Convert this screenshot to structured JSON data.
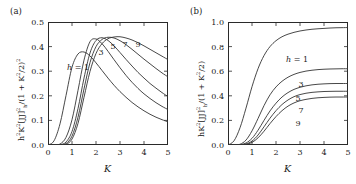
{
  "figure": {
    "panels": [
      {
        "tag": "(a)",
        "xlabel": "K",
        "ylabel_html": "h<sup>2</sup>K<sup>2</sup>[JJ]<sup>2</sup><sub>h</sub>/(1 + K<sup>2</sup>/2)<sup>2</sup>",
        "ylabel_text": "h2K2[JJ]2h/(1+K2/2)2",
        "yticks": [
          "0.0",
          "0.1",
          "0.2",
          "0.3",
          "0.4",
          "0.5"
        ],
        "xticks": [
          "0",
          "1",
          "2",
          "3",
          "4",
          "5"
        ],
        "curve_labels": [
          "h = 1",
          "3",
          "5",
          "7",
          "9"
        ]
      },
      {
        "tag": "(b)",
        "xlabel": "K",
        "ylabel_html": "hK<sup>2</sup>[JJ]<sup>2</sup><sub>h</sub>/(1 + K<sup>2</sup>/2)",
        "ylabel_text": "hK2[JJ]2h/(1+K2/2)",
        "yticks": [
          "0.0",
          "0.2",
          "0.4",
          "0.6",
          "0.8",
          "1.0"
        ],
        "xticks": [
          "0",
          "1",
          "2",
          "3",
          "4",
          "5"
        ],
        "curve_labels": [
          "h = 1",
          "3",
          "5",
          "7",
          "9"
        ]
      }
    ]
  },
  "chart_data": [
    {
      "type": "line",
      "panel": "a",
      "title": "",
      "xlabel": "K",
      "ylabel": "h^2 K^2 [JJ]^2_h / (1 + K^2/2)^2",
      "xlim": [
        0,
        5
      ],
      "ylim": [
        0,
        0.5
      ],
      "xticks": [
        0,
        1,
        2,
        3,
        4,
        5
      ],
      "yticks": [
        0.0,
        0.1,
        0.2,
        0.3,
        0.4,
        0.5
      ],
      "grid": false,
      "legend": "inline-curve-labels",
      "x": [
        0,
        0.25,
        0.5,
        0.75,
        1.0,
        1.25,
        1.5,
        1.75,
        2.0,
        2.25,
        2.5,
        2.75,
        3.0,
        3.25,
        3.5,
        3.75,
        4.0,
        4.25,
        4.5,
        4.75,
        5.0
      ],
      "series": [
        {
          "name": "h = 1",
          "peak_x": 1.2,
          "peak_y": 0.378,
          "values": [
            0.0,
            0.017,
            0.086,
            0.201,
            0.316,
            0.37,
            0.378,
            0.362,
            0.334,
            0.303,
            0.272,
            0.243,
            0.217,
            0.194,
            0.173,
            0.155,
            0.139,
            0.125,
            0.113,
            0.103,
            0.094
          ]
        },
        {
          "name": "3",
          "peak_x": 1.85,
          "peak_y": 0.432,
          "values": [
            0.0,
            0.0,
            0.004,
            0.031,
            0.103,
            0.222,
            0.345,
            0.42,
            0.431,
            0.412,
            0.381,
            0.347,
            0.314,
            0.283,
            0.255,
            0.23,
            0.208,
            0.189,
            0.172,
            0.157,
            0.144
          ]
        },
        {
          "name": "5",
          "peak_x": 2.2,
          "peak_y": 0.437,
          "values": [
            0.0,
            0.0,
            0.001,
            0.012,
            0.055,
            0.148,
            0.272,
            0.374,
            0.425,
            0.436,
            0.425,
            0.403,
            0.376,
            0.348,
            0.321,
            0.295,
            0.272,
            0.25,
            0.231,
            0.213,
            0.197
          ]
        },
        {
          "name": "7",
          "peak_x": 2.5,
          "peak_y": 0.44,
          "values": [
            0.0,
            0.0,
            0.0,
            0.006,
            0.036,
            0.113,
            0.228,
            0.335,
            0.4,
            0.429,
            0.438,
            0.435,
            0.424,
            0.408,
            0.389,
            0.369,
            0.349,
            0.33,
            0.311,
            0.293,
            0.277
          ]
        },
        {
          "name": "9",
          "peak_x": 2.85,
          "peak_y": 0.441,
          "values": [
            0.0,
            0.0,
            0.0,
            0.003,
            0.024,
            0.088,
            0.194,
            0.299,
            0.372,
            0.412,
            0.432,
            0.439,
            0.44,
            0.435,
            0.427,
            0.416,
            0.403,
            0.389,
            0.375,
            0.361,
            0.347
          ]
        }
      ]
    },
    {
      "type": "line",
      "panel": "b",
      "title": "",
      "xlabel": "K",
      "ylabel": "h K^2 [JJ]^2_h / (1 + K^2/2)",
      "xlim": [
        0,
        5
      ],
      "ylim": [
        0,
        1.0
      ],
      "xticks": [
        0,
        1,
        2,
        3,
        4,
        5
      ],
      "yticks": [
        0.0,
        0.2,
        0.4,
        0.6,
        0.8,
        1.0
      ],
      "grid": false,
      "legend": "inline-curve-labels",
      "x": [
        0,
        0.25,
        0.5,
        0.75,
        1.0,
        1.25,
        1.5,
        1.75,
        2.0,
        2.25,
        2.5,
        2.75,
        3.0,
        3.25,
        3.5,
        3.75,
        4.0,
        4.25,
        4.5,
        4.75,
        5.0
      ],
      "series": [
        {
          "name": "h = 1",
          "value_at_5": 0.955,
          "values": [
            0.0,
            0.034,
            0.14,
            0.3,
            0.474,
            0.62,
            0.727,
            0.8,
            0.848,
            0.88,
            0.901,
            0.916,
            0.927,
            0.935,
            0.941,
            0.945,
            0.948,
            0.951,
            0.953,
            0.954,
            0.955
          ]
        },
        {
          "name": "3",
          "value_at_5": 0.62,
          "values": [
            0.0,
            0.0,
            0.006,
            0.04,
            0.115,
            0.215,
            0.32,
            0.408,
            0.472,
            0.518,
            0.551,
            0.574,
            0.59,
            0.601,
            0.608,
            0.613,
            0.616,
            0.618,
            0.619,
            0.62,
            0.62
          ]
        },
        {
          "name": "5",
          "value_at_5": 0.5,
          "values": [
            0.0,
            0.0,
            0.002,
            0.016,
            0.054,
            0.12,
            0.2,
            0.277,
            0.34,
            0.39,
            0.426,
            0.452,
            0.469,
            0.481,
            0.489,
            0.494,
            0.497,
            0.499,
            0.5,
            0.5,
            0.5
          ]
        },
        {
          "name": "7",
          "value_at_5": 0.437,
          "values": [
            0.0,
            0.0,
            0.001,
            0.008,
            0.032,
            0.081,
            0.148,
            0.218,
            0.279,
            0.329,
            0.366,
            0.393,
            0.41,
            0.421,
            0.428,
            0.432,
            0.435,
            0.436,
            0.437,
            0.437,
            0.437
          ]
        },
        {
          "name": "9",
          "value_at_5": 0.39,
          "values": [
            0.0,
            0.0,
            0.0,
            0.005,
            0.021,
            0.058,
            0.112,
            0.174,
            0.231,
            0.279,
            0.316,
            0.342,
            0.36,
            0.371,
            0.379,
            0.384,
            0.387,
            0.389,
            0.39,
            0.39,
            0.39
          ]
        }
      ]
    }
  ]
}
